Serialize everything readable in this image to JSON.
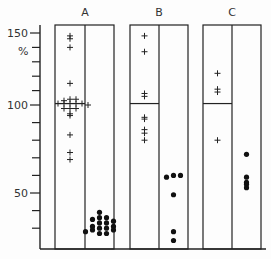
{
  "chart_data": {
    "type": "scatter",
    "title": "",
    "ylabel": "%",
    "y_ticks": [
      50,
      100,
      150
    ],
    "ylim": [
      20,
      155
    ],
    "grid": false,
    "groups": [
      {
        "label": "A",
        "crosses": [
          148,
          146,
          140,
          115,
          104,
          104,
          103,
          101,
          101,
          101,
          101,
          101,
          100,
          98,
          98,
          98,
          95,
          94,
          83,
          73,
          69
        ],
        "dots": [
          39,
          36,
          36,
          35,
          34,
          33,
          33,
          31,
          31,
          30,
          30,
          29,
          29,
          28,
          27,
          27
        ],
        "baseline": 101
      },
      {
        "label": "B",
        "crosses": [
          148,
          137,
          108,
          106,
          93,
          92,
          86,
          84,
          80
        ],
        "dots": [
          60,
          60,
          59,
          49,
          28,
          23
        ],
        "baseline": 101
      },
      {
        "label": "C",
        "crosses": [
          122,
          111,
          109,
          80
        ],
        "dots": [
          72,
          59,
          56,
          55,
          53
        ],
        "baseline": 101
      }
    ]
  }
}
